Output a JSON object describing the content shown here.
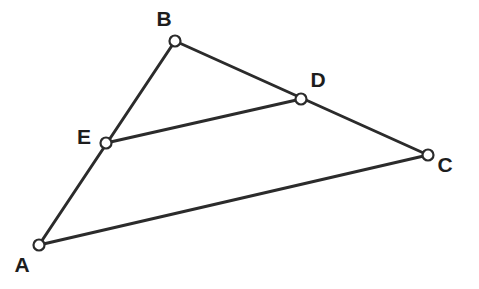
{
  "figure": {
    "background_color": "#ffffff",
    "stroke_color": "#2b2b2b",
    "label_color": "#1d1d1d",
    "vertex_fill": "#ffffff",
    "stroke_width": 3,
    "vertex_radius": 5.5
  },
  "points": {
    "A": {
      "label": "A",
      "x": 39,
      "y": 245,
      "label_x": 22,
      "label_y": 272
    },
    "B": {
      "label": "B",
      "x": 175,
      "y": 41,
      "label_x": 164,
      "label_y": 26
    },
    "C": {
      "label": "C",
      "x": 428,
      "y": 155,
      "label_x": 445,
      "label_y": 172
    },
    "D": {
      "label": "D",
      "x": 301,
      "y": 99,
      "label_x": 318,
      "label_y": 87
    },
    "E": {
      "label": "E",
      "x": 106,
      "y": 143,
      "label_x": 84,
      "label_y": 144
    }
  },
  "segments": [
    {
      "name": "segment-AB",
      "from": "A",
      "to": "B"
    },
    {
      "name": "segment-BC",
      "from": "B",
      "to": "C"
    },
    {
      "name": "segment-AC",
      "from": "A",
      "to": "C"
    },
    {
      "name": "segment-ED",
      "from": "E",
      "to": "D"
    }
  ],
  "point_order": [
    "A",
    "B",
    "C",
    "D",
    "E"
  ]
}
